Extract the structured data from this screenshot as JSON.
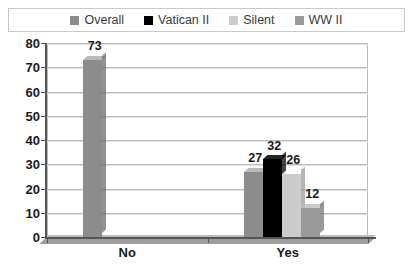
{
  "chart_data": {
    "type": "bar",
    "title": "",
    "subtitle": "",
    "xlabel": "",
    "ylabel": "",
    "categories": [
      "No",
      "Yes"
    ],
    "ylim": [
      0,
      80
    ],
    "yticks": [
      0,
      10,
      20,
      30,
      40,
      50,
      60,
      70,
      80
    ],
    "ytick_labels": [
      "0",
      "10",
      "20",
      "30",
      "40",
      "50",
      "60",
      "70",
      "80"
    ],
    "grid": true,
    "legend_position": "top",
    "style": "3d-clustered-column",
    "series": [
      {
        "name": "Overall",
        "color": "#8c8c8c",
        "values": [
          73,
          27
        ],
        "labels": [
          "73",
          "27"
        ]
      },
      {
        "name": "Vatican II",
        "color": "#000000",
        "values": [
          0,
          32
        ],
        "labels": [
          "",
          "32"
        ]
      },
      {
        "name": "Silent",
        "color": "#cccccc",
        "values": [
          0,
          26
        ],
        "labels": [
          "",
          "26"
        ]
      },
      {
        "name": "WW II",
        "color": "#9a9a9a",
        "values": [
          0,
          12
        ],
        "labels": [
          "",
          "12"
        ]
      }
    ]
  },
  "legend": {
    "items": [
      {
        "label": "Overall",
        "swatch": "#8c8c8c"
      },
      {
        "label": "Vatican II",
        "swatch": "#000000"
      },
      {
        "label": "Silent",
        "swatch": "#cccccc"
      },
      {
        "label": "WW II",
        "swatch": "#9a9a9a"
      }
    ]
  },
  "axes": {
    "y_tick_labels": [
      "80",
      "70",
      "60",
      "50",
      "40",
      "30",
      "20",
      "10",
      "0"
    ],
    "x_category_labels": [
      "No",
      "Yes"
    ]
  },
  "data_labels": [
    "73",
    "27",
    "32",
    "26",
    "12"
  ],
  "colors": {
    "overall": "#8c8c8c",
    "vatican_ii": "#000000",
    "silent": "#cccccc",
    "ww_ii": "#9a9a9a",
    "gridline": "#b9b9b9",
    "axis": "#555555",
    "text": "#1a1a1a",
    "background": "#ffffff"
  }
}
